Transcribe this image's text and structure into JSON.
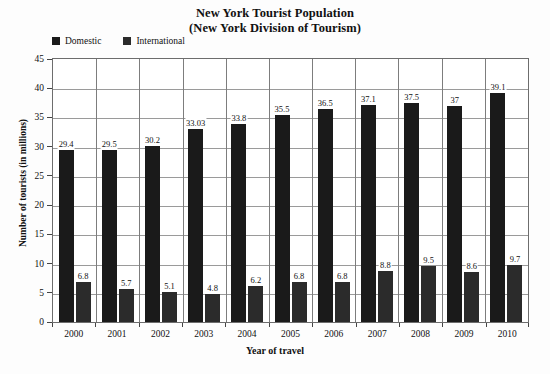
{
  "chart_data": {
    "type": "bar",
    "title": "New York Tourist Population",
    "subtitle": "(New York Division of Tourism)",
    "xlabel": "Year of travel",
    "ylabel": "Number of tourists (in millions)",
    "categories": [
      "2000",
      "2001",
      "2002",
      "2003",
      "2004",
      "2005",
      "2006",
      "2007",
      "2008",
      "2009",
      "2010"
    ],
    "series": [
      {
        "name": "Domestic",
        "color": "#1a1a1a",
        "values": [
          29.4,
          29.5,
          30.2,
          33.03,
          33.8,
          35.5,
          36.5,
          37.1,
          37.5,
          37,
          39.1
        ],
        "labels": [
          "29.4",
          "29.5",
          "30.2",
          "33.03",
          "33.8",
          "35.5",
          "36.5",
          "37.1",
          "37.5",
          "37",
          "39.1"
        ]
      },
      {
        "name": "International",
        "color": "#2b2b2b",
        "values": [
          6.8,
          5.7,
          5.1,
          4.8,
          6.2,
          6.8,
          6.8,
          8.8,
          9.5,
          8.6,
          9.7
        ],
        "labels": [
          "6.8",
          "5.7",
          "5.1",
          "4.8",
          "6.2",
          "6.8",
          "6.8",
          "8.8",
          "9.5",
          "8.6",
          "9.7"
        ]
      }
    ],
    "ylim": [
      0,
      45
    ],
    "yticks": [
      0,
      5,
      10,
      15,
      20,
      25,
      30,
      35,
      40,
      45
    ],
    "ytick_labels": [
      "0",
      "5",
      "10",
      "15",
      "20",
      "25",
      "30",
      "35",
      "40",
      "45"
    ],
    "grid": true,
    "legend_position": "top-left"
  }
}
